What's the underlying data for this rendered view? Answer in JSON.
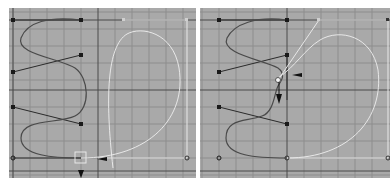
{
  "viewport": {
    "background": "#a9a9a9",
    "grid_minor_color": "#8a8a8a",
    "grid_major_color": "#3a3a3a",
    "curve_color": "#4a4a4a",
    "selected_curve_color": "#f0f0f0",
    "control_point_color": "#1e1e1e"
  },
  "panels": [
    {
      "name": "before-edit",
      "description": "Curve in S-shape with a CV selected at the bottom; move manipulator arrow pointing down"
    },
    {
      "name": "after-edit",
      "description": "CV moved up into the curve; move manipulator arrows pointing down and right"
    }
  ]
}
